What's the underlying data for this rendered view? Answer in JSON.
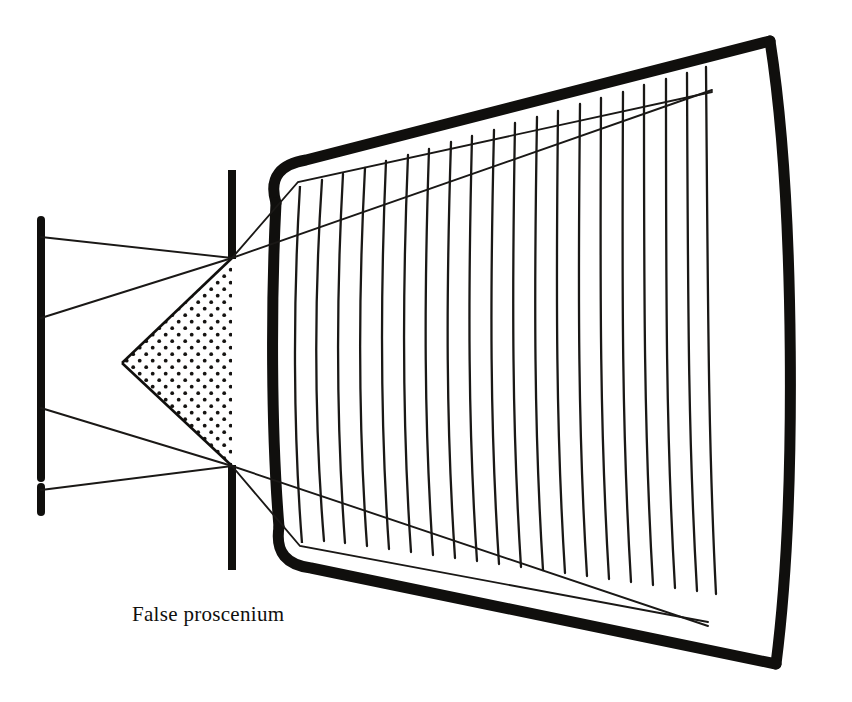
{
  "figure": {
    "domain": "Diagram",
    "kind": "theatre-sightline-plan",
    "background_color": "#ffffff",
    "ink_color": "#100f0d",
    "width": 852,
    "height": 702
  },
  "labels": {
    "false_proscenium": "False proscenium"
  },
  "colors": {
    "ink": "#100f0d",
    "paper": "#ffffff",
    "stipple": "#151311",
    "thin_line": "#1a1816"
  },
  "elements": {
    "setting_line": {
      "name": "setting-line-bar",
      "x": 41,
      "y_top": 220,
      "y_bottom": 512,
      "stroke_width": 8,
      "gap": {
        "y_top": 478,
        "y_bottom": 486
      }
    },
    "false_proscenium_bars": [
      {
        "name": "upper-proscenium-bar",
        "x": 232,
        "y_top": 170,
        "y_bottom": 258,
        "stroke_width": 8
      },
      {
        "name": "lower-proscenium-bar",
        "x": 232,
        "y_top": 465,
        "y_bottom": 570,
        "stroke_width": 8
      }
    ],
    "stipple_triangle": {
      "name": "masked-sightline-wedge",
      "apex": {
        "x": 122,
        "y": 363
      },
      "top": {
        "x": 232,
        "y": 258
      },
      "bottom": {
        "x": 232,
        "y": 466
      },
      "dot_radius": 1.9,
      "dot_pitch": 13
    },
    "auditorium": {
      "name": "auditorium-outline",
      "stroke_width": 11,
      "corners": {
        "top_left": {
          "x": 298,
          "y": 182
        },
        "top_right": {
          "x": 770,
          "y": 40
        },
        "bottom_right": {
          "x": 776,
          "y": 664
        },
        "bottom_left": {
          "x": 300,
          "y": 546
        }
      },
      "left_wall_bulge_x": 290,
      "right_wall_bulge_x": 800
    },
    "seating_rows": {
      "name": "seating-row-lines",
      "count": 19,
      "x_first": 320,
      "x_last": 705,
      "stroke_width": 2.2,
      "curvature": 12
    },
    "sightlines": [
      {
        "name": "sightline-upper-outer",
        "from": {
          "x": 41,
          "y": 237
        },
        "via": {
          "x": 232,
          "y": 258
        },
        "to": {
          "x": 712,
          "y": 90
        }
      },
      {
        "name": "sightline-upper-inner",
        "from": {
          "x": 41,
          "y": 318
        },
        "via": {
          "x": 232,
          "y": 258
        },
        "to": {
          "x": 712,
          "y": 92
        }
      },
      {
        "name": "sightline-lower-inner",
        "from": {
          "x": 41,
          "y": 408
        },
        "via": {
          "x": 232,
          "y": 466
        },
        "to": {
          "x": 708,
          "y": 622
        }
      },
      {
        "name": "sightline-lower-outer",
        "from": {
          "x": 41,
          "y": 490
        },
        "via": {
          "x": 232,
          "y": 466
        },
        "to": {
          "x": 708,
          "y": 626
        }
      },
      {
        "name": "sightline-corner-upper",
        "from": {
          "x": 232,
          "y": 258
        },
        "to": {
          "x": 298,
          "y": 182
        }
      },
      {
        "name": "sightline-corner-lower",
        "from": {
          "x": 232,
          "y": 466
        },
        "to": {
          "x": 300,
          "y": 546
        }
      },
      {
        "name": "sightline-house-upper",
        "from": {
          "x": 298,
          "y": 182
        },
        "to": {
          "x": 712,
          "y": 90
        }
      },
      {
        "name": "sightline-house-lower",
        "from": {
          "x": 300,
          "y": 546
        },
        "to": {
          "x": 708,
          "y": 624
        }
      }
    ]
  }
}
